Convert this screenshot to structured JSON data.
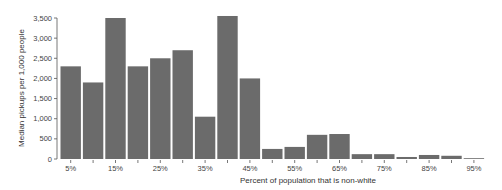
{
  "chart_data": {
    "type": "bar",
    "title": "",
    "xlabel": "Percent of population that is non-white",
    "ylabel": "Median pickups per 1,000 people",
    "ylim": [
      0,
      3500
    ],
    "yticks": [
      0,
      500,
      1000,
      1500,
      2000,
      2500,
      3000,
      3500
    ],
    "ytick_labels": [
      "0",
      "500",
      "1,000",
      "1,500",
      "2,000",
      "2,500",
      "3,000",
      "3,500"
    ],
    "categories": [
      "5%",
      "10%",
      "15%",
      "20%",
      "25%",
      "30%",
      "35%",
      "40%",
      "45%",
      "50%",
      "55%",
      "60%",
      "65%",
      "70%",
      "75%",
      "80%",
      "85%",
      "90%",
      "95%"
    ],
    "xtick_labels_shown": [
      "5%",
      "15%",
      "25%",
      "35%",
      "45%",
      "55%",
      "65%",
      "75%",
      "85%",
      "95%"
    ],
    "values": [
      2300,
      1900,
      3500,
      2300,
      2500,
      2700,
      1050,
      3550,
      2000,
      250,
      300,
      600,
      620,
      120,
      120,
      50,
      100,
      80,
      10
    ],
    "grid": false,
    "legend": null,
    "bar_color": "#6b6b6b"
  }
}
